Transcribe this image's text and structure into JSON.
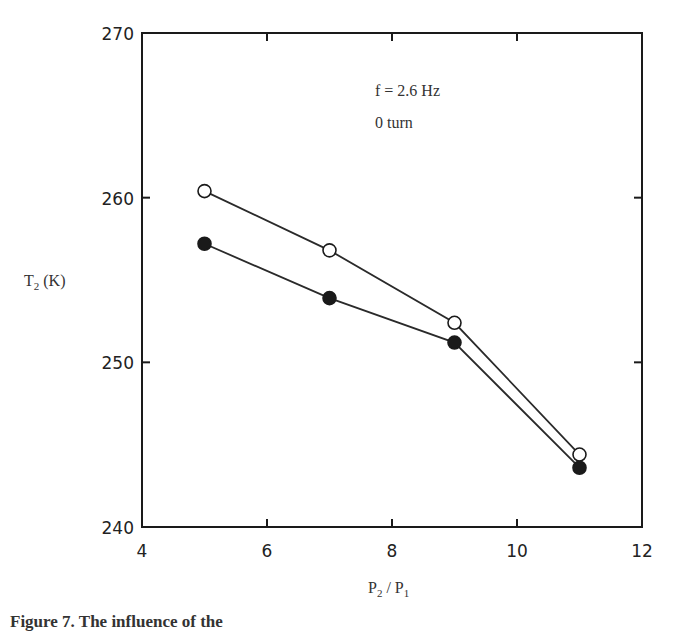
{
  "chart_data": {
    "type": "line",
    "title": "",
    "xlabel": "P2 / P1",
    "ylabel": "T2 (K)",
    "xlim": [
      4,
      12
    ],
    "ylim": [
      240,
      270
    ],
    "xticks": [
      4,
      6,
      8,
      10,
      12
    ],
    "yticks": [
      240,
      250,
      260,
      270
    ],
    "grid": false,
    "annotations": [
      "f = 2.6 Hz",
      "0 turn"
    ],
    "x": [
      5,
      7,
      9,
      11
    ],
    "series": [
      {
        "name": "open circles",
        "marker": "open-circle",
        "values": [
          260.4,
          256.8,
          252.4,
          244.4
        ]
      },
      {
        "name": "filled circles",
        "marker": "filled-circle",
        "values": [
          257.2,
          253.9,
          251.2,
          243.6
        ]
      }
    ]
  },
  "labels": {
    "y_axis_main": "T",
    "y_axis_sub": "2",
    "y_axis_unit": " (K)",
    "x_axis_p2": "P",
    "x_axis_p2_sub": "2",
    "x_axis_sep": " / ",
    "x_axis_p1": "P",
    "x_axis_p1_sub": "1",
    "annotation_freq": "f = 2.6 Hz",
    "annotation_turn": "0 turn",
    "caption_fragment": "Figure 7. The influence of the"
  },
  "colors": {
    "axis": "#1a1a1a",
    "line": "#2a2a2a",
    "marker_fill": "#1a1a1a",
    "background": "#ffffff"
  }
}
